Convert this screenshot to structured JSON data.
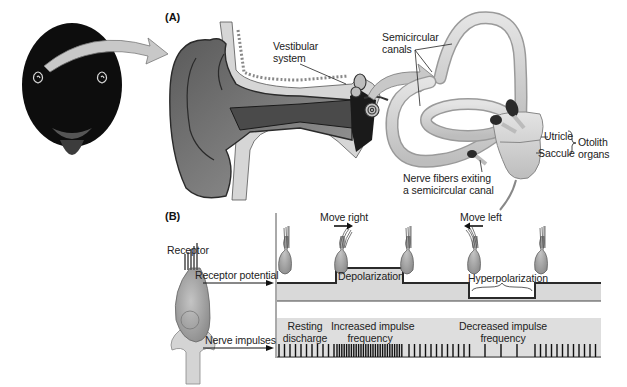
{
  "figure": {
    "panel_a": {
      "letter": "(A)",
      "labels": {
        "vestibular_system": [
          "Vestibular",
          "system"
        ],
        "semicircular_canals": [
          "Semicircular",
          "canals"
        ],
        "utricle": "Utricle",
        "saccule": "Saccule",
        "otolith_organs": [
          "Otolith",
          "organs"
        ],
        "nerve_fibers": [
          "Nerve fibers exiting",
          "a semicircular canal"
        ]
      }
    },
    "panel_b": {
      "letter": "(B)",
      "receptor_label": "Receptor",
      "receptor_potential_label": "Receptor potential",
      "nerve_impulses_label": "Nerve impulses",
      "move_right": "Move right",
      "move_left": "Move left",
      "depolarization": "Depolarization",
      "hyperpolarization": "Hyperpolarization",
      "resting_discharge": [
        "Resting",
        "discharge"
      ],
      "increased_frequency": [
        "Increased impulse",
        "frequency"
      ],
      "decreased_frequency": [
        "Decreased impulse",
        "frequency"
      ]
    },
    "colors": {
      "band_gray": "#d9d9d9",
      "line_dark": "#2a2a2a",
      "cell_gray": "#a8a8a8",
      "arrow_gray": "#c8c8c8"
    }
  }
}
